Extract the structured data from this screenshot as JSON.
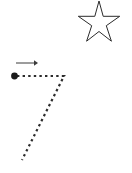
{
  "canvas": {
    "width": 132,
    "height": 173,
    "background_color": "#ffffff",
    "title": "Drag Path Sketch"
  },
  "colors": {
    "outline": "#2b2b2b",
    "arrow": "#3a3a3a",
    "dot": "#1a1a1a",
    "background": "#ffffff"
  },
  "shapes": {
    "star": {
      "icon_name": "star-outline-icon",
      "label": "Five pointed star outline",
      "center_x": 99,
      "center_y": 25,
      "outer_radius": 26,
      "inner_radius": 11,
      "points": 5,
      "rotation_deg": -90,
      "fill": "none",
      "stroke_color": "#2b2b2b",
      "stroke_width": 1,
      "points_path": "99,1 103.2,16.3 119.7,16.3 106.3,25.7 111.4,41.2 99,31.5 86.6,41.2 91.7,25.7 78.3,16.3 94.8,16.3"
    },
    "direction_arrow": {
      "icon_name": "arrow-right-icon",
      "label": "Rightward direction arrow",
      "x1": 16,
      "y1": 63,
      "x2": 34,
      "y2": 63,
      "head_path": "34,60.3 38,63 34,65.7",
      "stroke_color": "#3a3a3a",
      "stroke_width": 1
    },
    "start_dot": {
      "icon_name": "start-point-dot-icon",
      "label": "Drag start point",
      "cx": 14.5,
      "cy": 76,
      "r": 3.4,
      "fill": "#1a1a1a"
    },
    "drag_path": {
      "icon_name": "dashed-drag-path-icon",
      "label": "Dashed seven shaped drag path",
      "path_d": "M 17 76 L 64 76 L 22 160",
      "stroke_color": "#2b2b2b",
      "stroke_width": 2.2,
      "dash_pattern": "2.4 3.2",
      "vertices": [
        {
          "name": "start",
          "x": 17,
          "y": 76
        },
        {
          "name": "corner",
          "x": 64,
          "y": 76
        },
        {
          "name": "end",
          "x": 22,
          "y": 160
        }
      ]
    }
  },
  "accessibility": {
    "scene_description": "White canvas with a hollow five pointed star in the upper right, a short right pointing arrow on the left, and a filled dot leading into a dashed path shaped like the numeral seven."
  }
}
